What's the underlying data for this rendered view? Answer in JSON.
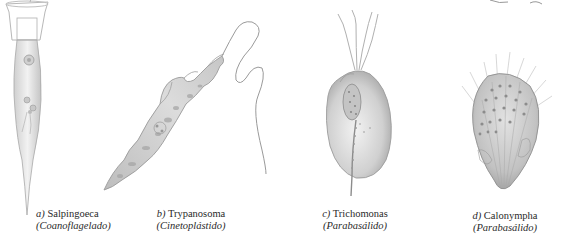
{
  "figure": {
    "panels": [
      {
        "id": "a",
        "letter": "a)",
        "genus": "Salpingoeca",
        "group": "(Coanoflagelado)",
        "icon": "choanoflagellate-illustration"
      },
      {
        "id": "b",
        "letter": "b)",
        "genus": "Trypanosoma",
        "group": "(Cinetoplástido)",
        "icon": "trypanosome-illustration"
      },
      {
        "id": "c",
        "letter": "c)",
        "genus": "Trichomonas",
        "group": "(Parabasálido)",
        "icon": "trichomonad-illustration"
      },
      {
        "id": "d",
        "letter": "d)",
        "genus": "Calonympha",
        "group": "(Parabasálido)",
        "icon": "calonymphid-illustration"
      }
    ],
    "colors": {
      "background": "#ffffff",
      "ink": "#2a2a2a",
      "body_light": "#e6e6e6",
      "body_mid": "#bdbdbd",
      "body_dark": "#8a8a8a"
    }
  }
}
